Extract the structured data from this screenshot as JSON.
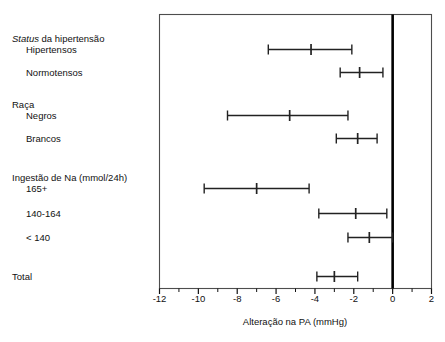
{
  "chart_data": {
    "type": "scatter",
    "subtype": "forest-plot",
    "title": "",
    "xlabel": "Alteração na PA (mmHg)",
    "ylabel": "",
    "xlim": [
      -12,
      2
    ],
    "xticks": [
      -12,
      -10,
      -8,
      -6,
      -4,
      -2,
      0,
      2
    ],
    "xtick_labels": [
      "-12",
      "-10",
      "-8",
      "-6",
      "-4",
      "-2",
      "0",
      "2"
    ],
    "minor_xticks": [
      -11,
      -9,
      -7,
      -5,
      -3,
      -1,
      1
    ],
    "grid": false,
    "legend": null,
    "reference_line": {
      "x": 0,
      "style": "thick-solid",
      "color": "#000000"
    },
    "rows": [
      {
        "kind": "group",
        "label": "Status da hipertensão",
        "label_italic_prefix": "Status",
        "y": 40
      },
      {
        "kind": "point",
        "label": "Hipertensos",
        "value": -4.2,
        "low": -6.4,
        "high": -2.1,
        "y": 49
      },
      {
        "kind": "point",
        "label": "Normotensos",
        "value": -1.7,
        "low": -2.7,
        "high": -0.5,
        "y": 72
      },
      {
        "kind": "group",
        "label": "Raça",
        "y": 106
      },
      {
        "kind": "point",
        "label": "Negros",
        "value": -5.3,
        "low": -8.5,
        "high": -2.3,
        "y": 115
      },
      {
        "kind": "point",
        "label": "Brancos",
        "value": -1.8,
        "low": -2.9,
        "high": -0.8,
        "y": 138
      },
      {
        "kind": "group",
        "label": "Ingestão de Na (mmol/24h)",
        "y": 179
      },
      {
        "kind": "point",
        "label": "165+",
        "value": -7.0,
        "low": -9.7,
        "high": -4.3,
        "y": 188
      },
      {
        "kind": "point",
        "label": "140-164",
        "value": -1.9,
        "low": -3.8,
        "high": -0.3,
        "y": 213
      },
      {
        "kind": "point",
        "label": "< 140",
        "value": -1.2,
        "low": -2.3,
        "high": 0.0,
        "y": 237
      },
      {
        "kind": "point",
        "label": "Total",
        "value": -3.0,
        "low": -3.9,
        "high": -1.8,
        "y": 276
      }
    ]
  },
  "axis": {
    "x_title": "Alteração na PA (mmHg)",
    "tick_labels": [
      "-12",
      "-10",
      "-8",
      "-6",
      "-4",
      "-2",
      "0",
      "2"
    ]
  },
  "labels": {
    "group_hypertension": "Status da hipertensão",
    "group_hypertension_italic": "Status",
    "group_hypertension_rest": " da hipertensão",
    "item_hipertensos": "Hipertensos",
    "item_normotensos": "Normotensos",
    "group_raca": "Raça",
    "item_negros": "Negros",
    "item_brancos": "Brancos",
    "group_ingestao": "Ingestão de Na (mmol/24h)",
    "item_165": "165+",
    "item_140_164": "140-164",
    "item_lt140": "< 140",
    "item_total": "Total"
  },
  "colors": {
    "ink": "#111111",
    "frame": "#4d4d4d",
    "marker": "#222222",
    "zero_line": "#000000",
    "background": "#ffffff"
  }
}
